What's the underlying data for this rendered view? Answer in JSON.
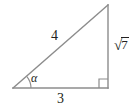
{
  "figure": {
    "kind": "right-triangle-diagram",
    "background_color": "#ffffff",
    "stroke_color": "#8c8c8c",
    "text_color": "#231f20",
    "labels": {
      "hypotenuse": "4",
      "base": "3",
      "vertical_radical_sign": "√",
      "vertical_radicand": "7",
      "vertical_full": "√7",
      "angle": "α"
    },
    "markers": {
      "right_angle": "right-angle-square",
      "angle_arc": "angle-arc"
    },
    "geometry": {
      "vertex_left": [
        13,
        88
      ],
      "vertex_bottom_right": [
        108,
        88
      ],
      "vertex_top_right": [
        108,
        5
      ],
      "base_length_label": "3",
      "vertical_length_label": "√7",
      "hypotenuse_length_label": "4",
      "angle_label": "α"
    }
  }
}
